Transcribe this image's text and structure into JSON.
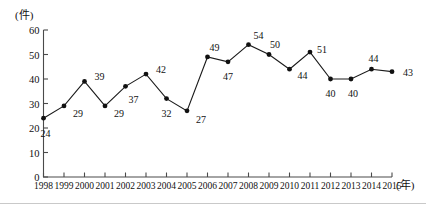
{
  "chart_data": {
    "type": "line",
    "title": "",
    "xlabel": "(年)",
    "ylabel": "(件)",
    "categories": [
      "1998",
      "1999",
      "2000",
      "2001",
      "2002",
      "2003",
      "2004",
      "2005",
      "2006",
      "2007",
      "2008",
      "2009",
      "2010",
      "2011",
      "2012",
      "2013",
      "2014",
      "2015"
    ],
    "values": [
      24,
      29,
      39,
      29,
      37,
      42,
      32,
      27,
      49,
      47,
      54,
      50,
      44,
      51,
      40,
      40,
      44,
      43
    ],
    "ylim": [
      0,
      60
    ],
    "yticks": [
      0,
      10,
      20,
      30,
      40,
      50,
      60
    ],
    "grid": false,
    "legend": false,
    "marker": "filled-circle",
    "line_color": "#1a1a1a",
    "marker_color": "#111111",
    "axis_color": "#555555",
    "data_labels_shown": true,
    "label_offsets": [
      {
        "year": "1998",
        "value": 24,
        "dx": 2,
        "dy": 15
      },
      {
        "year": "1999",
        "value": 29,
        "dx": 14,
        "dy": 7
      },
      {
        "year": "2000",
        "value": 39,
        "dx": 15,
        "dy": -5
      },
      {
        "year": "2001",
        "value": 29,
        "dx": 14,
        "dy": 7
      },
      {
        "year": "2002",
        "value": 37,
        "dx": 8,
        "dy": 13
      },
      {
        "year": "2003",
        "value": 42,
        "dx": 15,
        "dy": -5
      },
      {
        "year": "2004",
        "value": 32,
        "dx": 0,
        "dy": 14
      },
      {
        "year": "2005",
        "value": 27,
        "dx": 14,
        "dy": 8
      },
      {
        "year": "2006",
        "value": 49,
        "dx": 7,
        "dy": -10
      },
      {
        "year": "2007",
        "value": 47,
        "dx": 0,
        "dy": 14
      },
      {
        "year": "2008",
        "value": 54,
        "dx": 10,
        "dy": -10
      },
      {
        "year": "2009",
        "value": 50,
        "dx": 6,
        "dy": -11
      },
      {
        "year": "2010",
        "value": 44,
        "dx": 13,
        "dy": 6
      },
      {
        "year": "2011",
        "value": 51,
        "dx": 12,
        "dy": -3
      },
      {
        "year": "2012",
        "value": 40,
        "dx": 0,
        "dy": 14
      },
      {
        "year": "2013",
        "value": 40,
        "dx": 2,
        "dy": 14
      },
      {
        "year": "2014",
        "value": 44,
        "dx": 2,
        "dy": -11
      },
      {
        "year": "2015",
        "value": 43,
        "dx": 16,
        "dy": 0
      }
    ]
  },
  "axes": {
    "y_unit_label": "(件)",
    "x_unit_label": "(年)"
  }
}
